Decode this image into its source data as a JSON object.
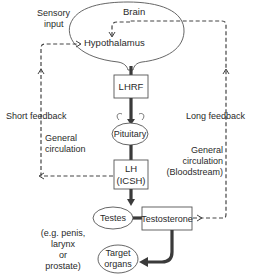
{
  "diagram": {
    "nodes": {
      "brain": "Brain",
      "hypothalamus": "Hypothalamus",
      "lhrf": "LHRF",
      "pituitary": "Pituitary",
      "lh_line1": "LH",
      "lh_line2": "(ICSH)",
      "testes": "Testes",
      "testosterone": "Testosterone",
      "target_line1": "Target",
      "target_line2": "organs"
    },
    "labels": {
      "sensory_line1": "Sensory",
      "sensory_line2": "input",
      "short_feedback": "Short feedback",
      "general_circ_left_line1": "General",
      "general_circ_left_line2": "circulation",
      "long_feedback": "Long feedback",
      "general_circ_right_line1": "General",
      "general_circ_right_line2": "circulation",
      "general_circ_right_line3": "(Bloodstream)",
      "examples_line1": "(e.g. penis,",
      "examples_line2": "larynx",
      "examples_line3": "or",
      "examples_line4": "prostate)"
    },
    "colors": {
      "line": "#3a3a3a",
      "text": "#2a2a2a",
      "background": "#ffffff"
    }
  }
}
